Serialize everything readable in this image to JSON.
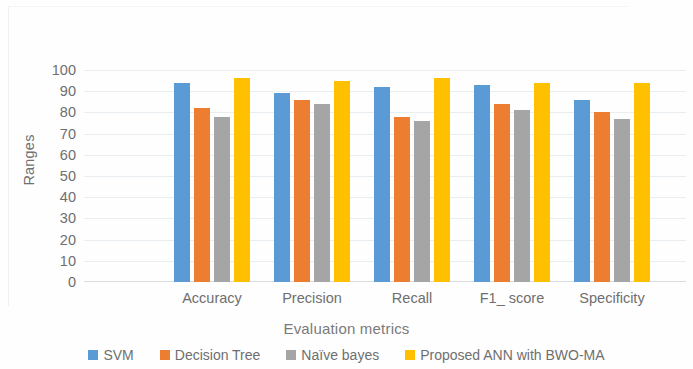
{
  "chart_data": {
    "type": "bar",
    "title": "",
    "xlabel": "Evaluation metrics",
    "ylabel": "Ranges",
    "categories": [
      "Accuracy",
      "Precision",
      "Recall",
      "F1_ score",
      "Specificity"
    ],
    "series": [
      {
        "name": "SVM",
        "color": "#5B9BD5",
        "values": [
          94,
          89,
          92,
          93,
          86
        ]
      },
      {
        "name": "Decision Tree",
        "color": "#ED7D31",
        "values": [
          82,
          86,
          78,
          84,
          80
        ]
      },
      {
        "name": "Naïve bayes",
        "color": "#A5A5A5",
        "values": [
          78,
          84,
          76,
          81,
          77
        ]
      },
      {
        "name": "Proposed ANN with BWO-MA",
        "color": "#FFC000",
        "values": [
          96,
          95,
          96,
          94,
          94
        ]
      }
    ],
    "ylim": [
      0,
      100
    ],
    "ytick_step": 10,
    "yticks": [
      100,
      90,
      80,
      70,
      60,
      50,
      40,
      30,
      20,
      10,
      0
    ],
    "grid": true,
    "legend_position": "bottom"
  },
  "legend": {
    "items": [
      {
        "label": "SVM",
        "color": "#5B9BD5"
      },
      {
        "label": "Decision Tree",
        "color": "#ED7D31"
      },
      {
        "label": "Naïve bayes",
        "color": "#A5A5A5"
      },
      {
        "label": "Proposed ANN with BWO-MA",
        "color": "#FFC000"
      }
    ]
  }
}
